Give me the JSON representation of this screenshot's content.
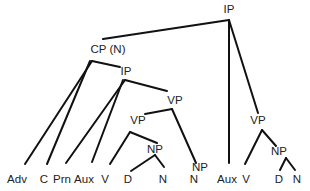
{
  "diagram": {
    "type": "syntax-tree",
    "nodes": {
      "ip_root": {
        "label": "IP",
        "x": 229,
        "y": 10
      },
      "cp": {
        "label": "CP (N)",
        "x": 108,
        "y": 50
      },
      "ip_inner": {
        "label": "IP",
        "x": 126,
        "y": 72
      },
      "vp_upper": {
        "label": "VP",
        "x": 175,
        "y": 101
      },
      "vp_lower": {
        "label": "VP",
        "x": 138,
        "y": 121
      },
      "np_lower": {
        "label": "NP",
        "x": 155,
        "y": 150
      },
      "np_standalone": {
        "label": "NP",
        "x": 200,
        "y": 168
      },
      "vp_right": {
        "label": "VP",
        "x": 258,
        "y": 121
      },
      "np_right": {
        "label": "NP",
        "x": 279,
        "y": 152
      }
    },
    "leaves": [
      {
        "label": "Adv",
        "x": 17,
        "y": 180
      },
      {
        "label": "C",
        "x": 44,
        "y": 180
      },
      {
        "label": "Prn",
        "x": 62,
        "y": 180
      },
      {
        "label": "Aux",
        "x": 84,
        "y": 180
      },
      {
        "label": "V",
        "x": 105,
        "y": 180
      },
      {
        "label": "D",
        "x": 128,
        "y": 180
      },
      {
        "label": "N",
        "x": 163,
        "y": 180
      },
      {
        "label": "N",
        "x": 194,
        "y": 180
      },
      {
        "label": "Aux",
        "x": 227,
        "y": 180
      },
      {
        "label": "V",
        "x": 246,
        "y": 180
      },
      {
        "label": "D",
        "x": 279,
        "y": 180
      },
      {
        "label": "N",
        "x": 297,
        "y": 180
      }
    ],
    "edges": [
      {
        "from": "IP",
        "to": "CP (N)",
        "x1": 229,
        "y1": 20,
        "x2": 103,
        "y2": 39
      },
      {
        "from": "IP",
        "to": "Aux",
        "x1": 229,
        "y1": 20,
        "x2": 229,
        "y2": 163
      },
      {
        "from": "IP",
        "to": "VP",
        "x1": 229,
        "y1": 20,
        "x2": 258,
        "y2": 113
      },
      {
        "from": "CP (N)",
        "to": "IP",
        "x1": 92,
        "y1": 61,
        "x2": 120,
        "y2": 67
      },
      {
        "from": "CP (N)",
        "to": "Adv",
        "x1": 92,
        "y1": 61,
        "x2": 25,
        "y2": 164
      },
      {
        "from": "CP (N)",
        "to": "C",
        "x1": 90,
        "y1": 61,
        "x2": 47,
        "y2": 164
      },
      {
        "from": "IP",
        "to": "VP",
        "x1": 125,
        "y1": 80,
        "x2": 167,
        "y2": 91
      },
      {
        "from": "IP",
        "to": "Prn",
        "x1": 125,
        "y1": 80,
        "x2": 66,
        "y2": 163
      },
      {
        "from": "IP",
        "to": "Aux",
        "x1": 123,
        "y1": 80,
        "x2": 92,
        "y2": 162
      },
      {
        "from": "VP",
        "to": "VP",
        "x1": 172,
        "y1": 109,
        "x2": 145,
        "y2": 114
      },
      {
        "from": "VP",
        "to": "NP",
        "x1": 172,
        "y1": 109,
        "x2": 196,
        "y2": 163
      },
      {
        "from": "VP",
        "to": "V",
        "x1": 130,
        "y1": 132,
        "x2": 110,
        "y2": 164
      },
      {
        "from": "VP",
        "to": "NP",
        "x1": 130,
        "y1": 132,
        "x2": 157,
        "y2": 143
      },
      {
        "from": "NP",
        "to": "D",
        "x1": 155,
        "y1": 155,
        "x2": 131,
        "y2": 171
      },
      {
        "from": "NP",
        "to": "N",
        "x1": 155,
        "y1": 155,
        "x2": 164,
        "y2": 167
      },
      {
        "from": "VP",
        "to": "V",
        "x1": 262,
        "y1": 130,
        "x2": 245,
        "y2": 164
      },
      {
        "from": "VP",
        "to": "NP",
        "x1": 262,
        "y1": 130,
        "x2": 276,
        "y2": 146
      },
      {
        "from": "NP",
        "to": "D",
        "x1": 286,
        "y1": 158,
        "x2": 280,
        "y2": 170
      },
      {
        "from": "NP",
        "to": "N",
        "x1": 286,
        "y1": 158,
        "x2": 295,
        "y2": 170
      }
    ],
    "colors": {
      "line": "#111111",
      "text": "#222222",
      "background": "#ffffff"
    }
  }
}
